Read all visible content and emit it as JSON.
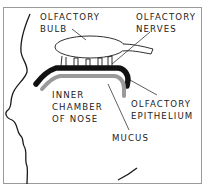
{
  "diagram": {
    "labels": {
      "olfactory_bulb": [
        "OLFACTORY",
        "BULB"
      ],
      "olfactory_nerves": [
        "OLFACTORY",
        "NERVES"
      ],
      "inner_chamber": [
        "INNER",
        "CHAMBER",
        "OF NOSE"
      ],
      "olfactory_epithelium": [
        "OLFACTORY",
        "EPITHELIUM"
      ],
      "mucus": "MUCUS"
    },
    "colors": {
      "outline": "#1a1a1a",
      "epithelium": "#111111",
      "mucus": "#9a9a9a",
      "frame": "#9a9a9a"
    }
  }
}
